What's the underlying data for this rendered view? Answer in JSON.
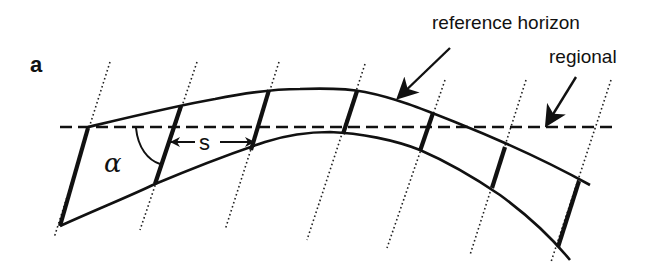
{
  "figure": {
    "panel_label": "a",
    "labels": {
      "reference_horizon": "reference horizon",
      "regional": "regional",
      "alpha": "α",
      "spacing": "s"
    },
    "colors": {
      "line": "#111111",
      "background": "#ffffff"
    },
    "elements": {
      "reference_horizon_upper": "solid curved line (anticline top)",
      "reference_horizon_lower": "solid curved line (anticline base)",
      "regional_datum": "horizontal dashed line",
      "dip_segments": "thick solid segments between horizons",
      "axial_traces": "dotted parallel inclined lines",
      "angle_arc": "arc marking angle alpha",
      "spacing_arrow": "double-headed arrow marking spacing s"
    }
  }
}
